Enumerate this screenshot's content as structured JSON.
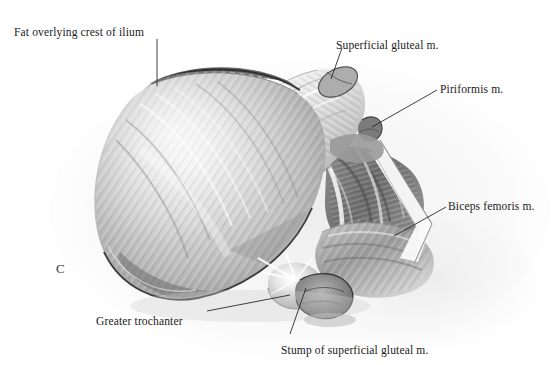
{
  "figure": {
    "panel_letter": "C",
    "medium": "grayscale-anatomical-illustration",
    "background_color": "#ffffff",
    "ink_color": "#1a1a1a"
  },
  "labels": [
    {
      "id": "fat-crest-ilium",
      "text": "Fat overlying crest of ilium",
      "x": 14,
      "y": 26,
      "align": "left"
    },
    {
      "id": "superficial-gluteal",
      "text": "Superficial gluteal m.",
      "x": 336,
      "y": 39,
      "align": "left"
    },
    {
      "id": "piriformis",
      "text": "Piriformis m.",
      "x": 440,
      "y": 83,
      "align": "left"
    },
    {
      "id": "biceps-femoris",
      "text": "Biceps femoris m.",
      "x": 448,
      "y": 200,
      "align": "left"
    },
    {
      "id": "greater-trochanter",
      "text": "Greater trochanter",
      "x": 96,
      "y": 315,
      "align": "left"
    },
    {
      "id": "stump-superficial",
      "text": "Stump of superficial gluteal m.",
      "x": 281,
      "y": 344,
      "align": "left"
    }
  ],
  "leaders": [
    {
      "id": "leader-fat-crest",
      "points": "157,39 157,86"
    },
    {
      "id": "leader-superficial-gluteal",
      "points": "342,48 331,79"
    },
    {
      "id": "leader-piriformis",
      "points": "437,90 372,127"
    },
    {
      "id": "leader-biceps-femoris",
      "points": "446,207 394,236"
    },
    {
      "id": "leader-greater-trochanter",
      "points": "207,311 290,295"
    },
    {
      "id": "leader-stump",
      "points": "290,334 306,288"
    }
  ],
  "structures": [
    {
      "id": "middle-gluteal-muscle",
      "name": "middle gluteal muscle belly"
    },
    {
      "id": "iliac-crest-fat-rim",
      "name": "fat overlying crest of ilium"
    },
    {
      "id": "superficial-gluteal-band",
      "name": "superficial gluteal muscle reflected band"
    },
    {
      "id": "superficial-gluteal-cut",
      "name": "superficial gluteal muscle cut end"
    },
    {
      "id": "piriformis-muscle",
      "name": "piriformis muscle"
    },
    {
      "id": "deep-gluteal-bundles",
      "name": "deep gluteal muscle bundles"
    },
    {
      "id": "biceps-femoris-muscle",
      "name": "biceps femoris muscle"
    },
    {
      "id": "greater-trochanter-bone",
      "name": "greater trochanter"
    },
    {
      "id": "gluteal-stump",
      "name": "stump of superficial gluteal muscle"
    }
  ]
}
